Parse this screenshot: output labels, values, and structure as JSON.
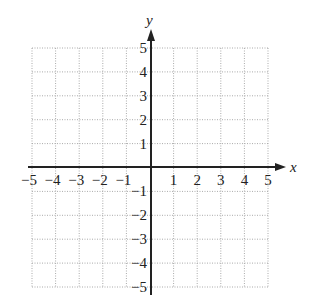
{
  "chart_data": {
    "type": "line",
    "title": "",
    "xlabel": "x",
    "ylabel": "y",
    "xlim": [
      -5,
      5
    ],
    "ylim": [
      -5,
      5
    ],
    "grid": true,
    "grid_style": "dotted",
    "x_ticks": [
      "−5",
      "−4",
      "−3",
      "−2",
      "−1",
      "1",
      "2",
      "3",
      "4",
      "5"
    ],
    "y_ticks": [
      "5",
      "4",
      "3",
      "2",
      "1",
      "−1",
      "−2",
      "−3",
      "−4",
      "−5"
    ],
    "series": []
  },
  "axes": {
    "x_label": "x",
    "y_label": "y"
  },
  "colors": {
    "axis": "#222222",
    "grid": "#aaaaaa"
  }
}
